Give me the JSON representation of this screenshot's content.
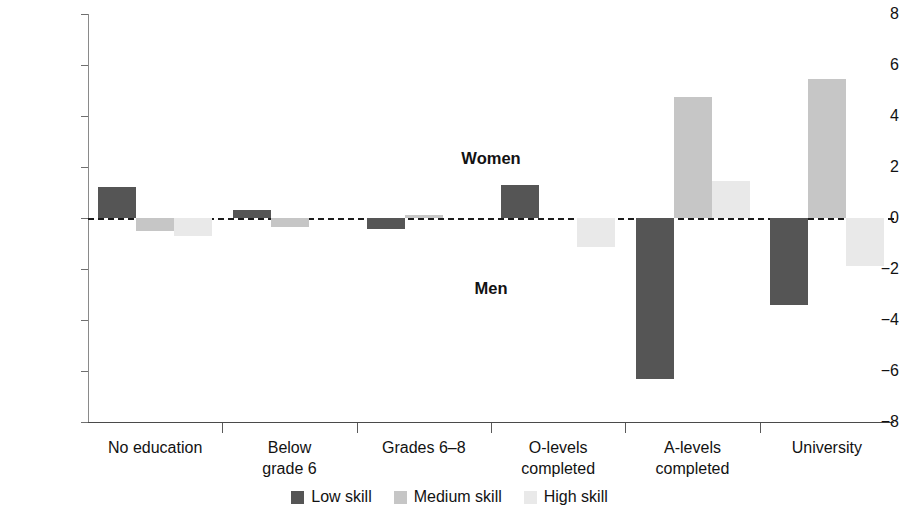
{
  "chart_data": {
    "type": "bar",
    "title": "",
    "subtitle": "",
    "xlabel": "",
    "ylabel": "Percentage-point difference",
    "ylim": [
      -8,
      8
    ],
    "yticks": [
      8,
      6,
      4,
      2,
      0,
      -2,
      -4,
      -6,
      -8
    ],
    "ytick_labels": [
      "8",
      "6",
      "4",
      "2",
      "0",
      "−2",
      "−4",
      "−6",
      "−8"
    ],
    "grid": false,
    "zero_line": true,
    "legend_position": "bottom-center",
    "categories": [
      "No education",
      "Below grade 6",
      "Grades 6–8",
      "O-levels completed",
      "A-levels completed",
      "University"
    ],
    "category_label_lines": [
      [
        "No education"
      ],
      [
        "Below",
        "grade 6"
      ],
      [
        "Grades 6–8"
      ],
      [
        "O-levels",
        "completed"
      ],
      [
        "A-levels",
        "completed"
      ],
      [
        "University"
      ]
    ],
    "series": [
      {
        "name": "Low skill",
        "color": "#555555",
        "values": [
          1.2,
          0.3,
          -0.45,
          1.3,
          -6.3,
          -3.4
        ]
      },
      {
        "name": "Medium skill",
        "color": "#c6c6c6",
        "values": [
          -0.5,
          -0.35,
          0.12,
          0.0,
          4.75,
          5.45
        ]
      },
      {
        "name": "High skill",
        "color": "#e9e9e9",
        "values": [
          -0.7,
          0.0,
          0.0,
          -1.15,
          1.45,
          -1.9
        ]
      }
    ],
    "annotations": [
      {
        "text": "Women",
        "x_value": 3.0,
        "y_value": 2.3
      },
      {
        "text": "Men",
        "x_value": 3.0,
        "y_value": -2.8
      }
    ]
  },
  "legend": {
    "entries": [
      {
        "label": "Low skill",
        "swatch": "low"
      },
      {
        "label": "Medium skill",
        "swatch": "medium"
      },
      {
        "label": "High skill",
        "swatch": "high"
      }
    ]
  }
}
